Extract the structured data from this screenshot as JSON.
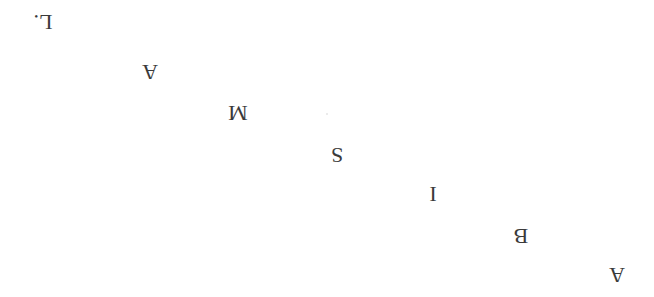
{
  "word": "ABISMAL.",
  "orientation": "rotated 180 degrees",
  "letters": [
    {
      "char": "A",
      "x": 617,
      "y": 275
    },
    {
      "char": "B",
      "x": 521,
      "y": 236
    },
    {
      "char": "I",
      "x": 433,
      "y": 194
    },
    {
      "char": "S",
      "x": 337,
      "y": 155
    },
    {
      "char": "M",
      "x": 238,
      "y": 113
    },
    {
      "char": "A",
      "x": 150,
      "y": 72
    },
    {
      "char": "L.",
      "x": 43,
      "y": 22
    }
  ],
  "colors": {
    "text": "#3a3a3a",
    "background": "#ffffff"
  }
}
